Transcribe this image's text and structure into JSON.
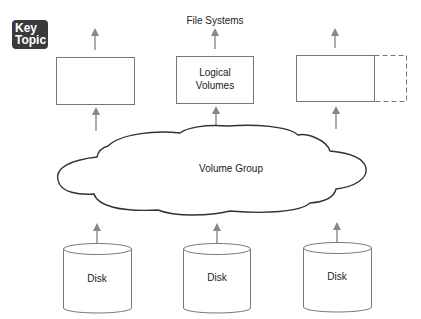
{
  "badge": {
    "line1": "Key",
    "line2": "Topic",
    "background": "#3a3a3a",
    "text_color": "#ffffff"
  },
  "diagram": {
    "title": "File Systems",
    "logical_volumes": [
      {
        "label": ""
      },
      {
        "label_line1": "Logical",
        "label_line2": "Volumes"
      },
      {
        "label": "",
        "has_dashed_extension": true
      }
    ],
    "volume_group": {
      "label": "Volume Group"
    },
    "disks": [
      {
        "label": "Disk"
      },
      {
        "label": "Disk"
      },
      {
        "label": "Disk"
      }
    ],
    "colors": {
      "stroke": "#777777",
      "arrow": "#888888",
      "cloud_stroke": "#333333",
      "text": "#222222"
    }
  }
}
